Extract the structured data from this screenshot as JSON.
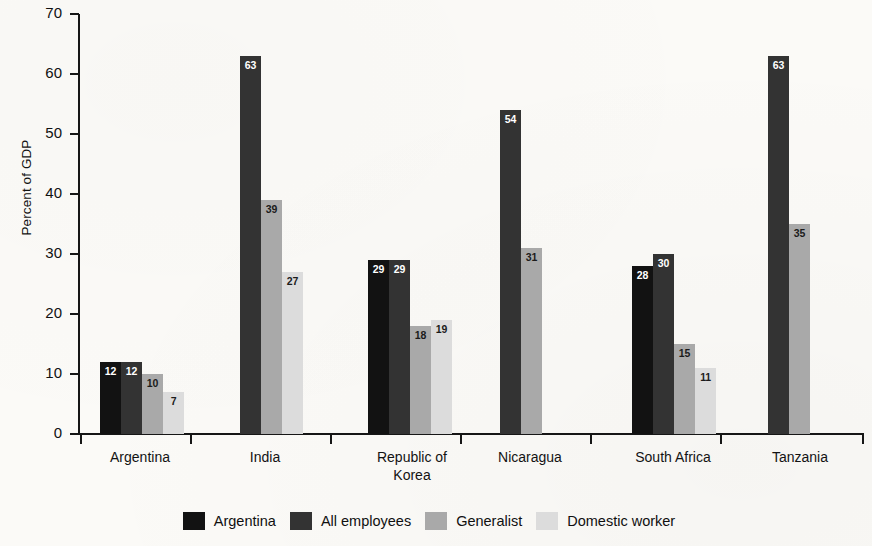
{
  "chart_data": {
    "type": "bar",
    "title": "",
    "xlabel": "",
    "ylabel": "Percent of GDP",
    "ylim": [
      0,
      70
    ],
    "ytick_labels": [
      "0",
      "10",
      "20",
      "30",
      "40",
      "50",
      "60",
      "70"
    ],
    "ytick_values": [
      0,
      10,
      20,
      30,
      40,
      50,
      60,
      70
    ],
    "grid": false,
    "legend_position": "bottom",
    "categories": [
      "Argentina",
      "India",
      "Republic of Korea",
      "Nicaragua",
      "South Africa",
      "Tanzania"
    ],
    "category_label_lines": [
      [
        "Argentina"
      ],
      [
        "India"
      ],
      [
        "Republic of",
        "Korea"
      ],
      [
        "Nicaragua"
      ],
      [
        "South Africa"
      ],
      [
        "Tanzania"
      ]
    ],
    "series": [
      {
        "name": "Argentina",
        "color": "#121212",
        "values": [
          12,
          null,
          29,
          null,
          28,
          null
        ]
      },
      {
        "name": "All employees",
        "color": "#333333",
        "values": [
          12,
          63,
          29,
          54,
          30,
          63
        ]
      },
      {
        "name": "Generalist",
        "color": "#a9a9a9",
        "values": [
          10,
          39,
          18,
          31,
          15,
          35
        ]
      },
      {
        "name": "Domestic worker",
        "color": "#dcdcdc",
        "values": [
          7,
          27,
          19,
          null,
          11,
          null
        ]
      }
    ],
    "bars": [
      {
        "category": "Argentina",
        "series": "Argentina",
        "value": 12,
        "label": "12",
        "label_color": "light"
      },
      {
        "category": "Argentina",
        "series": "All employees",
        "value": 12,
        "label": "12",
        "label_color": "light"
      },
      {
        "category": "Argentina",
        "series": "Generalist",
        "value": 10,
        "label": "10",
        "label_color": "dark"
      },
      {
        "category": "Argentina",
        "series": "Domestic worker",
        "value": 7,
        "label": "7",
        "label_color": "dark"
      },
      {
        "category": "India",
        "series": "All employees",
        "value": 63,
        "label": "63",
        "label_color": "light"
      },
      {
        "category": "India",
        "series": "Generalist",
        "value": 39,
        "label": "39",
        "label_color": "dark"
      },
      {
        "category": "India",
        "series": "Domestic worker",
        "value": 27,
        "label": "27",
        "label_color": "dark"
      },
      {
        "category": "Republic of Korea",
        "series": "Argentina",
        "value": 29,
        "label": "29",
        "label_color": "light"
      },
      {
        "category": "Republic of Korea",
        "series": "All employees",
        "value": 29,
        "label": "29",
        "label_color": "light"
      },
      {
        "category": "Republic of Korea",
        "series": "Generalist",
        "value": 18,
        "label": "18",
        "label_color": "dark"
      },
      {
        "category": "Republic of Korea",
        "series": "Domestic worker",
        "value": 19,
        "label": "19",
        "label_color": "dark"
      },
      {
        "category": "Nicaragua",
        "series": "All employees",
        "value": 54,
        "label": "54",
        "label_color": "light"
      },
      {
        "category": "Nicaragua",
        "series": "Generalist",
        "value": 31,
        "label": "31",
        "label_color": "dark"
      },
      {
        "category": "South Africa",
        "series": "Argentina",
        "value": 28,
        "label": "28",
        "label_color": "light"
      },
      {
        "category": "South Africa",
        "series": "All employees",
        "value": 30,
        "label": "30",
        "label_color": "light"
      },
      {
        "category": "South Africa",
        "series": "Generalist",
        "value": 15,
        "label": "15",
        "label_color": "dark"
      },
      {
        "category": "South Africa",
        "series": "Domestic worker",
        "value": 11,
        "label": "11",
        "label_color": "dark"
      },
      {
        "category": "Tanzania",
        "series": "All employees",
        "value": 63,
        "label": "63",
        "label_color": "light"
      },
      {
        "category": "Tanzania",
        "series": "Generalist",
        "value": 35,
        "label": "35",
        "label_color": "dark"
      }
    ],
    "legend": [
      {
        "label": "Argentina",
        "color": "#121212"
      },
      {
        "label": "All employees",
        "color": "#333333"
      },
      {
        "label": "Generalist",
        "color": "#a9a9a9"
      },
      {
        "label": "Domestic worker",
        "color": "#dcdcdc"
      }
    ]
  },
  "layout": {
    "plot_left": 80,
    "plot_right": 864,
    "plot_top": 14,
    "plot_bottom": 434,
    "bar_width": 21,
    "group_starts": [
      100,
      240,
      368,
      500,
      632,
      768
    ],
    "category_centers": [
      140,
      265,
      412,
      530,
      673,
      800
    ],
    "xtick_positions": [
      80,
      190,
      330,
      460,
      590,
      720,
      862
    ]
  }
}
